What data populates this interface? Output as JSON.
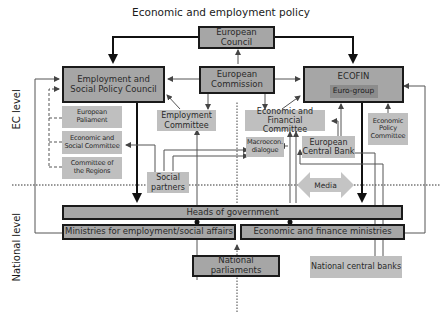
{
  "title": "Economic and employment policy",
  "side_labels": {
    "ec": "EC level",
    "national": "National level"
  },
  "nodes": {
    "european_council": "European Council",
    "european_commission": "European Commission",
    "employment_social_council": "Employment and Social Policy Council",
    "ecofin": "ECOFIN",
    "euro_group": "Euro-group",
    "european_parliament": "European Paliament",
    "economic_social_committee": "Economic and Social Committee",
    "committee_regions": "Committee of the Regions",
    "employment_committee": "Employment Committee",
    "economic_financial_committee": "Economic and Financial Committee",
    "economic_policy_committee": "Economic Policy Committee",
    "macroecon_dialogue": "Macroecon. dialogue",
    "european_central_bank": "European Central Bank",
    "social_partners": "Social partners",
    "media": "Media",
    "heads_of_government": "Heads of government",
    "ministries_employment": "Ministries for employment/social affairs",
    "economic_finance_ministries": "Economic and finance ministries",
    "national_parliaments": "National parliaments",
    "national_central_banks": "National central banks"
  },
  "colors": {
    "dark_box": "#a6a6a6",
    "light_box": "#bfbfbf",
    "inner_box": "#8c8c8c",
    "border": "#1a1a1a",
    "line": "#555555",
    "media_arrow": "#c4c4c4"
  }
}
